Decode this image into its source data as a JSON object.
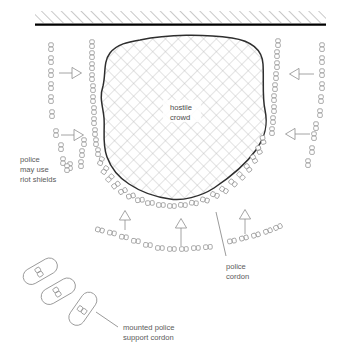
{
  "diagram": {
    "labels": {
      "crowd_line1": "hostile",
      "crowd_line2": "crowd",
      "riot_line1": "police",
      "riot_line2": "may use",
      "riot_line3": "riot shields",
      "cordon_line1": "police",
      "cordon_line2": "cordon",
      "mounted_line1": "mounted police",
      "mounted_line2": "support cordon"
    },
    "colors": {
      "ink": "#333333",
      "figure_stroke": "#8a8a8a",
      "text": "#5a5a5a",
      "hatch": "#b9b9b9",
      "wall": "#000000",
      "background": "#ffffff"
    },
    "elements": {
      "wall_band": "hatched-barrier-top",
      "crowd_blob": "hostile-crowd-area",
      "crowd_fill": "cross-hatch",
      "police_cordon": "ring-of-officer-figures",
      "reserve_columns": 4,
      "arrows": 6,
      "mounted_units": 3
    },
    "counts": {
      "mounted_police": 3,
      "arrow_indicators": 6
    }
  }
}
